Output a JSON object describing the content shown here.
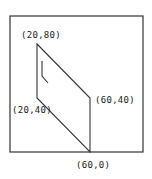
{
  "diagram": {
    "type": "parallelogram-on-grid",
    "frame": {
      "x": 10,
      "y": 16,
      "width": 133,
      "height": 136
    },
    "vertices": [
      {
        "id": "A",
        "label": "(20,80)",
        "px": 37,
        "py": 44,
        "label_x": 21,
        "label_y": 38
      },
      {
        "id": "B",
        "label": "(60,40)",
        "px": 90,
        "py": 98,
        "label_x": 95,
        "label_y": 103
      },
      {
        "id": "C",
        "label": "(60,0)",
        "px": 90,
        "py": 152,
        "label_x": 76,
        "label_y": 168
      },
      {
        "id": "D",
        "label": "(20,40)",
        "px": 37,
        "py": 98,
        "label_x": 12,
        "label_y": 113
      }
    ],
    "marker": {
      "points": "42,61 42,76 48,83"
    },
    "colors": {
      "stroke": "#333333",
      "text": "#222222",
      "background": "#ffffff"
    }
  }
}
